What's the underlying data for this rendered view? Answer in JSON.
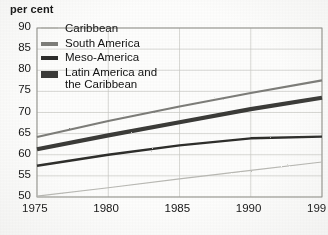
{
  "chart_data": {
    "type": "line",
    "title": "",
    "ylabel": "per cent",
    "xlabel": "",
    "xlim": [
      1975,
      1995
    ],
    "ylim": [
      50,
      90
    ],
    "ytick_labels": [
      "90",
      "85",
      "80",
      "75",
      "70",
      "65",
      "60",
      "55",
      "50"
    ],
    "ytick_values": [
      90,
      85,
      80,
      75,
      70,
      65,
      60,
      55,
      50
    ],
    "xtick_labels": [
      "1975",
      "1980",
      "1985",
      "1990",
      "199"
    ],
    "xtick_values": [
      1975,
      1980,
      1985,
      1990,
      1995
    ],
    "grid": true,
    "legend_position": "top-left",
    "x": [
      1975,
      1980,
      1985,
      1990,
      1995
    ],
    "series": [
      {
        "name": "Caribbean",
        "values": [
          50.2,
          52.2,
          54.3,
          56.3,
          58.3
        ],
        "color": "#b9b9b4",
        "width": 1.1,
        "swatch_height": 2
      },
      {
        "name": "South America",
        "values": [
          64.2,
          68.0,
          71.4,
          74.6,
          77.6
        ],
        "color": "#7d7d79",
        "width": 2.1,
        "swatch_height": 4
      },
      {
        "name": "Meso-America",
        "values": [
          57.4,
          60.0,
          62.2,
          63.9,
          64.3
        ],
        "color": "#2d2d2c",
        "width": 2.3,
        "swatch_height": 4
      },
      {
        "name": "Latin America and\nthe Caribbean",
        "values": [
          61.3,
          64.6,
          67.7,
          70.8,
          73.5
        ],
        "color": "#3a3a38",
        "width": 4.2,
        "swatch_height": 7
      }
    ]
  }
}
